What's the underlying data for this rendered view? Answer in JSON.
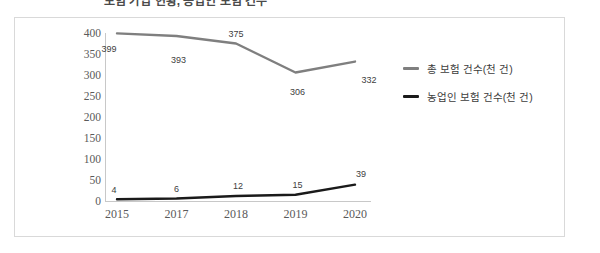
{
  "title_strip": {
    "text": "보험 가입 현황, 농업인 보험 건수"
  },
  "chart_data": {
    "type": "line",
    "title": "",
    "xlabel": "",
    "ylabel": "",
    "ylim": [
      0,
      400
    ],
    "yticks": [
      400,
      350,
      300,
      250,
      200,
      150,
      100,
      50,
      0
    ],
    "grid": false,
    "legend_position": "right",
    "categories": [
      "2015",
      "2017",
      "2018",
      "2019",
      "2020"
    ],
    "series": [
      {
        "name": "총 보험 건수(천 건)",
        "color": "#7f7f7f",
        "values": [
          399,
          393,
          375,
          306,
          332
        ],
        "labels": [
          "399",
          "393",
          "375",
          "306",
          "332"
        ]
      },
      {
        "name": "농업인 보험 건수(천 건)",
        "color": "#1a1a1a",
        "values": [
          4,
          6,
          12,
          15,
          39
        ],
        "labels": [
          "4",
          "6",
          "12",
          "15",
          "39"
        ]
      }
    ]
  },
  "legend": {
    "items": [
      {
        "label": "총 보험 건수(천 건)",
        "color": "#7f7f7f"
      },
      {
        "label": "농업인 보험 건수(천 건)",
        "color": "#1a1a1a"
      }
    ]
  },
  "colors": {
    "frame_border": "#d9d9d9",
    "axis": "#c8c8c8",
    "series_total": "#7f7f7f",
    "series_farmer": "#1a1a1a",
    "background": "#ffffff"
  }
}
